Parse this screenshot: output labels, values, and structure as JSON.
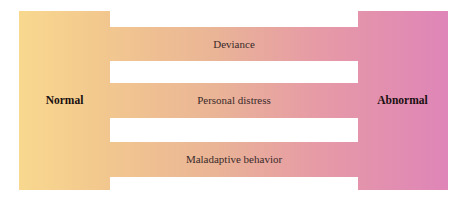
{
  "diagram": {
    "left_label": "Normal",
    "right_label": "Abnormal",
    "bands": [
      {
        "label": "Deviance"
      },
      {
        "label": "Personal distress"
      },
      {
        "label": "Maladaptive behavior"
      }
    ],
    "colors": {
      "normal_end": "#f8d88f",
      "middle": "#eab596",
      "abnormal_end": "#df85b8",
      "text": "#3a2a2a"
    }
  }
}
